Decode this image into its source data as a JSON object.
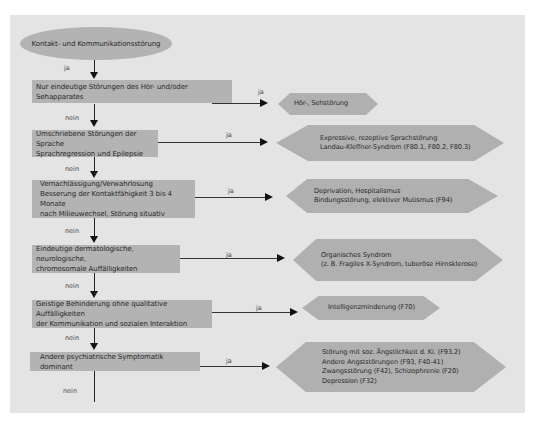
{
  "diagram": {
    "start": "Kontakt- und Kommunikationsstörung",
    "start_edge_label": "ja",
    "decisions": [
      {
        "lines": [
          "Nur eindeutige Störungen des Hör- und/oder Sehapparates"
        ],
        "yes_label": "ja",
        "no_label": "nein",
        "outcome": [
          "Hör-, Sehstörung"
        ]
      },
      {
        "lines": [
          "Umschriebene Störungen der Sprache",
          "Sprachregression und Epilepsie"
        ],
        "yes_label": "ja",
        "no_label": "nein",
        "outcome": [
          "Expressive, rezeptive Sprachstörung",
          "Landau-Kleffner-Syndrom (F80.1, F80.2, F80.3)"
        ]
      },
      {
        "lines": [
          "Vernachlässigung/Verwahrlosung",
          "Besserung der Kontaktfähigkeit 3 bis 4 Monate",
          "nach Milieuwechsel, Störung situativ"
        ],
        "yes_label": "ja",
        "no_label": "nein",
        "outcome": [
          "Deprivation, Hospitalismus",
          "Bindungsstörung, elektiver Mutismus (F94)"
        ]
      },
      {
        "lines": [
          "Eindeutige dermatologische, neurologische,",
          "chromosomale Auffälligkeiten"
        ],
        "yes_label": "ja",
        "no_label": "nein",
        "outcome": [
          "Organisches Syndrom",
          "(z. B. Fragiles X-Syndrom, tuberöse Hirnsklerose)"
        ]
      },
      {
        "lines": [
          "Geistige Behinderung ohne qualitative Auffälligkeiten",
          "der Kommunikation und sozialen Interaktion"
        ],
        "yes_label": "ja",
        "no_label": "nein",
        "outcome": [
          "Intelligenzminderung (F70)"
        ]
      },
      {
        "lines": [
          "Andere psychiatrische Symptomatik dominant"
        ],
        "yes_label": "ja",
        "no_label": "nein",
        "outcome": [
          "Störung mit soz. Ängstlichkeit d. Ki. (F93.2)",
          "Andere Angststörungen (F93, F40-41)",
          "Zwangsstörung (F42), Schizophrenie (F20)",
          "Depression (F32)"
        ]
      }
    ]
  },
  "colors": {
    "panel": "#e4e4e4",
    "node_fill": "#b3b3b3",
    "line": "#222222"
  }
}
